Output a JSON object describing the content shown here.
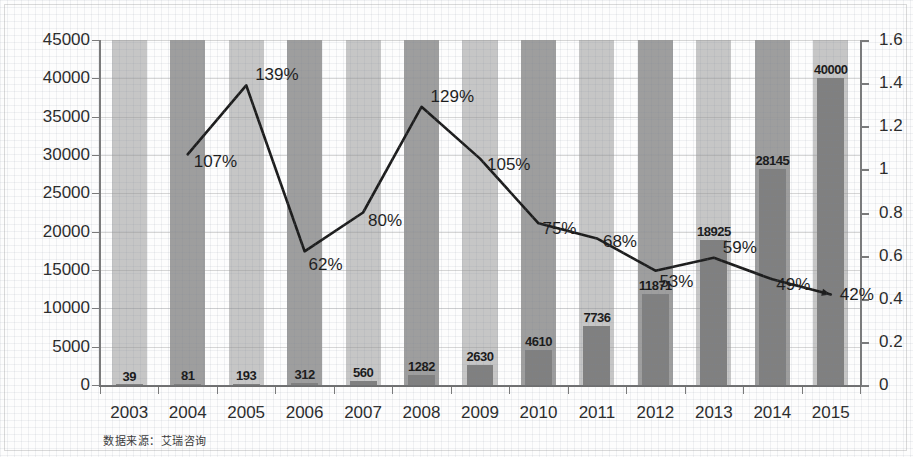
{
  "chart_data": {
    "type": "bar",
    "title": "",
    "subtitle": "",
    "xlabel": "",
    "ylabel": "",
    "y2label": "",
    "categories": [
      "2003",
      "2004",
      "2005",
      "2006",
      "2007",
      "2008",
      "2009",
      "2010",
      "2011",
      "2012",
      "2013",
      "2014",
      "2015"
    ],
    "ylim": [
      0,
      45000
    ],
    "y2lim": [
      0,
      1.6
    ],
    "grid": true,
    "legend": null,
    "y_ticks": [
      "0",
      "5000",
      "10000",
      "15000",
      "20000",
      "25000",
      "30000",
      "35000",
      "40000",
      "45000"
    ],
    "y_tick_values": [
      0,
      5000,
      10000,
      15000,
      20000,
      25000,
      30000,
      35000,
      40000,
      45000
    ],
    "y2_ticks": [
      "0",
      "0.2",
      "0.4",
      "0.6",
      "0.8",
      "1",
      "1.2",
      "1.4",
      "1.6"
    ],
    "y2_tick_values": [
      0,
      0.2,
      0.4,
      0.6,
      0.8,
      1,
      1.2,
      1.4,
      1.6
    ],
    "series": [
      {
        "name": "market_size",
        "type": "bar",
        "axis": "left",
        "color": "#808080",
        "values": [
          39,
          81,
          193,
          312,
          560,
          1282,
          2630,
          4610,
          7736,
          11871,
          18925,
          28145,
          40000
        ],
        "labels": [
          "39",
          "81",
          "193",
          "312",
          "560",
          "1282",
          "2630",
          "4610",
          "7736",
          "11871",
          "18925",
          "28145",
          "40000"
        ]
      },
      {
        "name": "growth_rate",
        "type": "line",
        "axis": "right",
        "color": "#1d1d1d",
        "values": [
          null,
          1.07,
          1.39,
          0.62,
          0.8,
          1.29,
          1.05,
          0.75,
          0.68,
          0.53,
          0.59,
          0.49,
          0.42
        ],
        "labels": [
          "",
          "107%",
          "139%",
          "62%",
          "80%",
          "129%",
          "105%",
          "75%",
          "68%",
          "53%",
          "59%",
          "49%",
          "42%"
        ]
      }
    ],
    "source_note": "数据来源：艾瑞咨询"
  }
}
